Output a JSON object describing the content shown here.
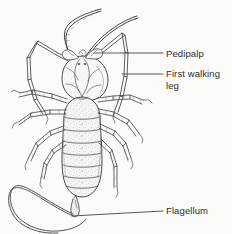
{
  "figure": {
    "name": "whip-scorpion-dorsal-diagram",
    "view": "dorsal",
    "style": "pencil line drawing with stipple shading",
    "background_color": "#fbfbfa",
    "ink_color": "#4a4a4a",
    "leader_line_color": "#3a3a3a",
    "text_color": "#2b2b2b"
  },
  "labels": [
    {
      "id": "pedipalp",
      "text": "Pedipalp",
      "text_x": 166,
      "text_y": 48,
      "leader": {
        "x1": 122,
        "y1": 53,
        "x2": 163,
        "y2": 53
      }
    },
    {
      "id": "first-walking-leg",
      "text": "First walking\nleg",
      "text_x": 166,
      "text_y": 68,
      "leader": {
        "x1": 122,
        "y1": 74,
        "x2": 163,
        "y2": 74
      }
    },
    {
      "id": "flagellum",
      "text": "Flagellum",
      "text_x": 166,
      "text_y": 205,
      "leader": {
        "x1": 72,
        "y1": 216,
        "x2": 163,
        "y2": 211
      }
    }
  ],
  "anatomy": {
    "cephalothorax": "rounded carapace with median ridge",
    "abdomen_segments": 9,
    "flagellum": "long segmented whip curving into a loop at lower left",
    "walking_legs_per_side": 4,
    "antenniform_legs": "first pair elongated and held forward in a wide arch"
  }
}
